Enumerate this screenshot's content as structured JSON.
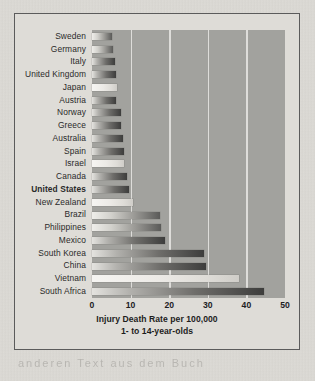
{
  "chart_data": {
    "type": "bar",
    "orientation": "horizontal",
    "title": "Injury Death Rate per 100,000",
    "subtitle": "1- to 14-year-olds",
    "xlabel": "Injury Death Rate per 100,000",
    "ylabel": "",
    "xlim": [
      0,
      50
    ],
    "xticks": [
      "0",
      "10",
      "20",
      "30",
      "40",
      "50"
    ],
    "grid": "vertical gridlines at 10, 20, 30, 40",
    "legend": "none",
    "highlight": "United States",
    "categories": [
      "Sweden",
      "Germany",
      "Italy",
      "United Kingdom",
      "Japan",
      "Austria",
      "Norway",
      "Greece",
      "Australia",
      "Spain",
      "Israel",
      "Canada",
      "United States",
      "New Zealand",
      "Brazil",
      "Philippines",
      "Mexico",
      "South Korea",
      "China",
      "Vietnam",
      "South Africa"
    ],
    "values": [
      5.2,
      5.5,
      6.0,
      6.1,
      6.5,
      6.2,
      7.4,
      7.5,
      8.1,
      8.2,
      8.3,
      9.0,
      9.5,
      10.5,
      17.5,
      18.0,
      19.0,
      29.0,
      29.5,
      38.0,
      44.5
    ]
  },
  "chart": {
    "axis_title_line1": "Injury Death Rate per 100,000",
    "axis_title_line2": "1- to 14-year-olds"
  },
  "bleed_text": "anderen  Text  aus  dem  Buch"
}
